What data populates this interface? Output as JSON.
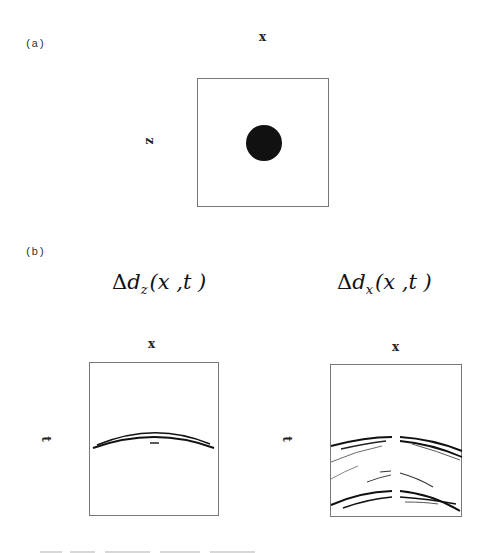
{
  "figure": {
    "panel_a": {
      "label": "(a)",
      "x_axis_label": "x",
      "z_axis_label": "z",
      "description": "square model domain with a single filled circular anomaly"
    },
    "panel_b": {
      "label": "(b)",
      "left_plot": {
        "title_prefix": "Δ",
        "title_var": "d",
        "title_sub": "z",
        "title_args": "(x ,t )",
        "x_axis_label": "x",
        "t_axis_label": "t"
      },
      "right_plot": {
        "title_prefix": "Δ",
        "title_var": "d",
        "title_sub": "x",
        "title_args": "(x ,t )",
        "x_axis_label": "x",
        "t_axis_label": "t"
      }
    }
  },
  "colors": {
    "ink": "#111111",
    "frame": "#777777",
    "caption_faint": "#d0d0d0"
  }
}
